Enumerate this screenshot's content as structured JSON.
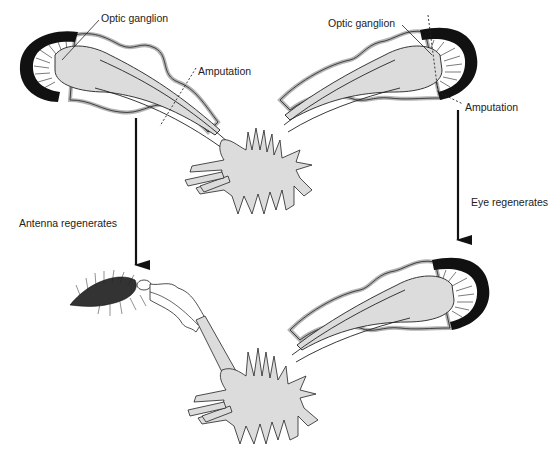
{
  "labels": {
    "optic_ganglion_left": "Optic ganglion",
    "amputation_left": "Amputation",
    "optic_ganglion_right": "Optic ganglion",
    "amputation_right": "Amputation",
    "antenna_regenerates": "Antenna regenerates",
    "eye_regenerates": "Eye regenerates"
  },
  "colors": {
    "ganglion_fill": "#dcdcdc",
    "stalk_outline_gray": "#b4b4b4",
    "ink": "#111111",
    "background": "#ffffff"
  }
}
